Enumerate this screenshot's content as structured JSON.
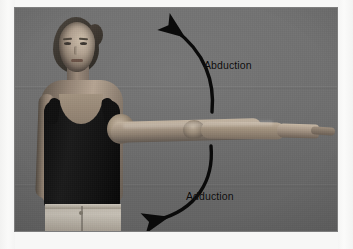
{
  "page": {
    "background_color": "#f7f7f6"
  },
  "photo": {
    "name": "shoulder-abduction-adduction-demonstration",
    "backdrop_color": "#6c6c6c",
    "border_color": "#7d7d7d",
    "subject": {
      "description": "woman standing facing camera, right arm raised horizontally out to the side",
      "top_garment": "black tank top",
      "top_garment_color": "#121212",
      "bottom_garment": "light denim jeans",
      "bottom_garment_color": "#bdb6aa",
      "hair_color": "#3b362f",
      "skin_tone": "#a89784"
    },
    "annotations": [
      {
        "id": "abduction",
        "label": "Abduction",
        "direction": "upward",
        "arrow_color": "#0a0a0a",
        "arrowhead": "top-left",
        "label_x": 189,
        "label_y": 51
      },
      {
        "id": "adduction",
        "label": "Adduction",
        "direction": "downward",
        "arrow_color": "#0a0a0a",
        "arrowhead": "bottom-left",
        "label_x": 171,
        "label_y": 182
      }
    ]
  }
}
